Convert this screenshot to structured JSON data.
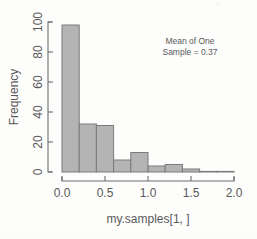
{
  "figure": {
    "kind": "histogram-plot",
    "background_color": "#fdfdfc",
    "bar_fill_color": "#b4b4b4",
    "bar_border_color": "#7b7b7b",
    "axis_color": "#6e6e6e",
    "text_color": "#5a5a5a"
  },
  "annotation": {
    "line1": "Mean of One",
    "line2": "Sample = 0.37"
  },
  "axis": {
    "x_title": "my.samples[1, ]",
    "y_title": "Frequency",
    "x_ticks": [
      "0.0",
      "0.5",
      "1.0",
      "1.5",
      "2.0"
    ],
    "y_ticks": [
      "0",
      "20",
      "40",
      "60",
      "80",
      "100"
    ]
  },
  "chart_data": {
    "type": "bar",
    "title": "",
    "subtitle": "",
    "xlabel": "my.samples[1, ]",
    "ylabel": "Frequency",
    "xlim": [
      0.0,
      2.0
    ],
    "ylim": [
      0,
      100
    ],
    "xticks": [
      0.0,
      0.5,
      1.0,
      1.5,
      2.0
    ],
    "yticks": [
      0,
      20,
      40,
      60,
      80,
      100
    ],
    "grid": false,
    "legend": null,
    "bin_width": 0.2,
    "bin_edges": [
      0.0,
      0.2,
      0.4,
      0.6,
      0.8,
      1.0,
      1.2,
      1.4,
      1.6,
      1.8,
      2.0
    ],
    "categories": [
      "0.0-0.2",
      "0.2-0.4",
      "0.4-0.6",
      "0.6-0.8",
      "0.8-1.0",
      "1.0-1.2",
      "1.2-1.4",
      "1.4-1.6",
      "1.6-1.8",
      "1.8-2.0"
    ],
    "values": [
      98,
      32,
      31,
      8,
      13,
      4,
      5,
      2,
      0,
      0
    ],
    "annotations": [
      "Mean of One",
      "Sample = 0.37"
    ]
  }
}
